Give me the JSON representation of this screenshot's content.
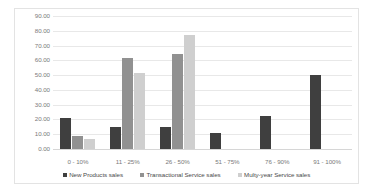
{
  "chart_data": {
    "type": "bar",
    "title": "",
    "subtitle": "",
    "xlabel": "",
    "ylabel": "",
    "ylim": [
      0,
      90
    ],
    "ytick_step": 10,
    "ytick_labels": [
      "90.00",
      "80.00",
      "70.00",
      "60.00",
      "50.00",
      "40.00",
      "30.00",
      "20.00",
      "10.00",
      "0.00"
    ],
    "grid": true,
    "legend_position": "bottom",
    "categories": [
      "0 - 10%",
      "11 - 25%",
      "26 - 50%",
      "51 - 75%",
      "76 - 90%",
      "91 - 100%"
    ],
    "series": [
      {
        "name": "New Products sales",
        "color": "#3f3f3f",
        "values": [
          21.0,
          15.0,
          15.0,
          11.0,
          22.5,
          50.0
        ]
      },
      {
        "name": "Transactional Service sales",
        "color": "#919191",
        "values": [
          9.0,
          61.5,
          64.5,
          0,
          0,
          0
        ]
      },
      {
        "name": "Multy-year Service sales",
        "color": "#cfcfcf",
        "values": [
          7.0,
          51.5,
          77.0,
          0,
          0,
          0
        ]
      }
    ]
  },
  "legend": {
    "items": [
      {
        "label": "New Products sales",
        "color": "#3f3f3f"
      },
      {
        "label": "Transactional Service sales",
        "color": "#919191"
      },
      {
        "label": "Multy-year Service sales",
        "color": "#cfcfcf"
      }
    ]
  }
}
